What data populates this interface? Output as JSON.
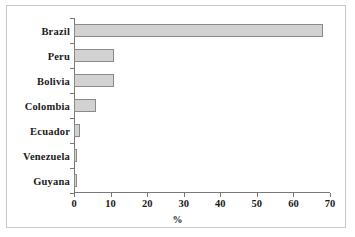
{
  "chart_data": {
    "type": "bar",
    "orientation": "horizontal",
    "title": "",
    "xlabel": "%",
    "ylabel": "",
    "categories": [
      "Brazil",
      "Peru",
      "Bolivia",
      "Colombia",
      "Ecuador",
      "Venezuela",
      "Guyana"
    ],
    "values": [
      68,
      11,
      11,
      6,
      1.7,
      0.9,
      0.8
    ],
    "xlim": [
      0,
      70
    ],
    "xticks": [
      0,
      10,
      20,
      30,
      40,
      50,
      60,
      70
    ],
    "xtick_labels": [
      "0",
      "10",
      "20",
      "30",
      "40",
      "50",
      "60",
      "70"
    ],
    "grid": false,
    "legend": null,
    "bar_fill_color": "#d2d2d2",
    "bar_border_color": "#8a8a8a",
    "axis_color": "#777777",
    "frame_color": "#c9c9c9",
    "background_color": "#ffffff"
  }
}
